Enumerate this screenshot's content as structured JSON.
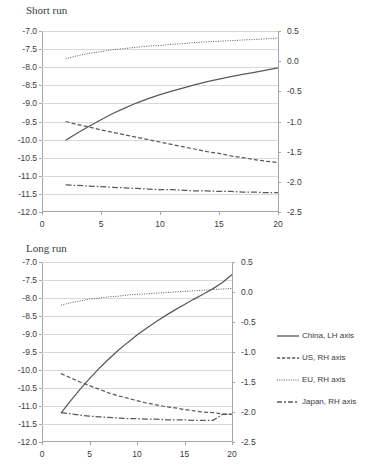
{
  "chart_data": [
    {
      "type": "line",
      "title": "Short run",
      "xlabel": "",
      "ylabel": "",
      "xlim": [
        0,
        20
      ],
      "xticks": [
        0,
        5,
        10,
        15,
        20
      ],
      "left_axis": {
        "label": "LH axis",
        "ylim": [
          -12.0,
          -7.0
        ],
        "yticks": [
          "-7.0",
          "-7.5",
          "-8.0",
          "-8.5",
          "-9.0",
          "-9.5",
          "-10.0",
          "-10.5",
          "-11.0",
          "-11.5",
          "-12.0"
        ]
      },
      "right_axis": {
        "label": "RH axis",
        "ylim": [
          -2.5,
          0.5
        ],
        "yticks": [
          "0.5",
          "0.0",
          "-0.5",
          "-1.0",
          "-1.5",
          "-2.0",
          "-2.5"
        ]
      },
      "grid": true,
      "legend_position": "right",
      "x": [
        2,
        3,
        4,
        5,
        6,
        7,
        8,
        9,
        10,
        11,
        12,
        13,
        14,
        15,
        16,
        17,
        18,
        19,
        20
      ],
      "series": [
        {
          "name": "China, LH axis",
          "axis": "left",
          "style": "solid",
          "values": [
            -10.02,
            -9.82,
            -9.63,
            -9.45,
            -9.28,
            -9.13,
            -8.99,
            -8.87,
            -8.76,
            -8.66,
            -8.57,
            -8.48,
            -8.4,
            -8.33,
            -8.26,
            -8.2,
            -8.14,
            -8.08,
            -8.02
          ]
        },
        {
          "name": "US, RH axis",
          "axis": "right",
          "style": "dashed",
          "values": [
            -1.0,
            -1.05,
            -1.09,
            -1.14,
            -1.18,
            -1.22,
            -1.26,
            -1.3,
            -1.34,
            -1.38,
            -1.42,
            -1.46,
            -1.5,
            -1.53,
            -1.57,
            -1.6,
            -1.63,
            -1.66,
            -1.68
          ]
        },
        {
          "name": "EU, RH axis",
          "axis": "right",
          "style": "dotted",
          "values": [
            0.04,
            0.09,
            0.13,
            0.16,
            0.19,
            0.21,
            0.23,
            0.25,
            0.26,
            0.28,
            0.29,
            0.31,
            0.32,
            0.33,
            0.34,
            0.35,
            0.36,
            0.37,
            0.38
          ]
        },
        {
          "name": "Japan, RH axis",
          "axis": "right",
          "style": "dashdot",
          "values": [
            -2.05,
            -2.06,
            -2.07,
            -2.08,
            -2.09,
            -2.1,
            -2.11,
            -2.12,
            -2.13,
            -2.13,
            -2.14,
            -2.15,
            -2.15,
            -2.16,
            -2.16,
            -2.17,
            -2.17,
            -2.18,
            -2.18
          ]
        }
      ]
    },
    {
      "type": "line",
      "title": "Long run",
      "xlabel": "",
      "ylabel": "",
      "xlim": [
        0,
        20
      ],
      "xticks": [
        0,
        5,
        10,
        15,
        20
      ],
      "left_axis": {
        "label": "LH axis",
        "ylim": [
          -12.0,
          -7.0
        ],
        "yticks": [
          "-7.0",
          "-7.5",
          "-8.0",
          "-8.5",
          "-9.0",
          "-9.5",
          "-10.0",
          "-10.5",
          "-11.0",
          "-11.5",
          "-12.0"
        ]
      },
      "right_axis": {
        "label": "RH axis",
        "ylim": [
          -2.5,
          0.5
        ],
        "yticks": [
          "0.5",
          "0.0",
          "-0.5",
          "-1.0",
          "-1.5",
          "-2.0",
          "-2.5"
        ]
      },
      "grid": true,
      "legend_position": "right",
      "x": [
        2,
        3,
        4,
        5,
        6,
        7,
        8,
        9,
        10,
        11,
        12,
        13,
        14,
        15,
        16,
        17,
        18,
        19,
        20
      ],
      "series": [
        {
          "name": "China, LH axis",
          "axis": "left",
          "style": "solid",
          "values": [
            -11.2,
            -10.86,
            -10.54,
            -10.24,
            -9.96,
            -9.7,
            -9.46,
            -9.24,
            -9.03,
            -8.84,
            -8.66,
            -8.49,
            -8.33,
            -8.18,
            -8.03,
            -7.89,
            -7.74,
            -7.57,
            -7.35
          ]
        },
        {
          "name": "US, RH axis",
          "axis": "right",
          "style": "dashed",
          "values": [
            -1.36,
            -1.43,
            -1.5,
            -1.56,
            -1.62,
            -1.68,
            -1.73,
            -1.77,
            -1.81,
            -1.85,
            -1.88,
            -1.91,
            -1.93,
            -1.96,
            -1.98,
            -2.0,
            -2.01,
            -2.03,
            -2.04
          ]
        },
        {
          "name": "EU, RH axis",
          "axis": "right",
          "style": "dotted",
          "values": [
            -0.22,
            -0.18,
            -0.15,
            -0.12,
            -0.1,
            -0.08,
            -0.07,
            -0.05,
            -0.04,
            -0.03,
            -0.02,
            -0.01,
            0.0,
            0.01,
            0.02,
            0.03,
            0.04,
            0.05,
            0.06
          ]
        },
        {
          "name": "Japan, RH axis",
          "axis": "right",
          "style": "dashdot",
          "values": [
            -2.01,
            -2.03,
            -2.05,
            -2.07,
            -2.08,
            -2.09,
            -2.1,
            -2.11,
            -2.11,
            -2.12,
            -2.12,
            -2.13,
            -2.13,
            -2.13,
            -2.14,
            -2.14,
            -2.14,
            -2.04,
            -2.04
          ]
        }
      ]
    }
  ],
  "legend": {
    "items": [
      {
        "label": "China, LH axis",
        "style": "solid"
      },
      {
        "label": "US, RH axis",
        "style": "dashed"
      },
      {
        "label": "EU, RH axis",
        "style": "dotted"
      },
      {
        "label": "Japan, RH axis",
        "style": "dashdot"
      }
    ]
  },
  "colors": {
    "line": "#595959",
    "grid": "#d9d9d9",
    "axis": "#a6a6a6",
    "text": "#3b3b3b",
    "background": "#ffffff"
  }
}
